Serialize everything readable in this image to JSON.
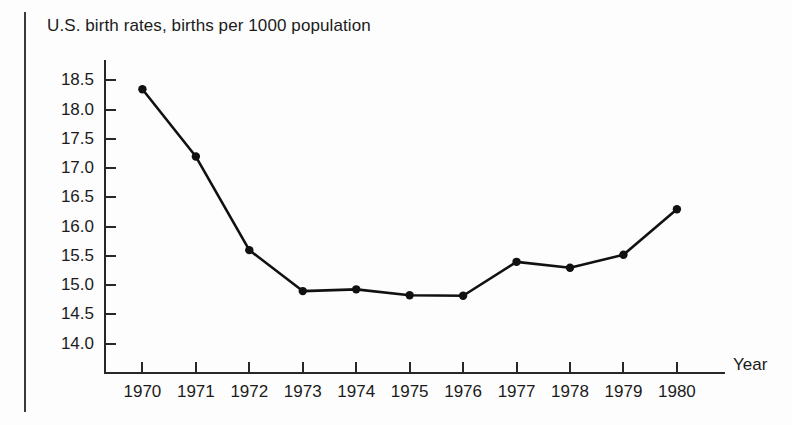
{
  "figure": {
    "title": "U.S. birth rates, births per 1000 population",
    "x_axis_title": "Year"
  },
  "chart_data": {
    "type": "line",
    "title": "U.S. birth rates, births per 1000 population",
    "xlabel": "Year",
    "ylabel": "",
    "categories": [
      "1970",
      "1971",
      "1972",
      "1973",
      "1974",
      "1975",
      "1976",
      "1977",
      "1978",
      "1979",
      "1980"
    ],
    "x": [
      1970,
      1971,
      1972,
      1973,
      1974,
      1975,
      1976,
      1977,
      1978,
      1979,
      1980
    ],
    "values": [
      18.35,
      17.2,
      15.6,
      14.9,
      14.93,
      14.83,
      14.82,
      15.4,
      15.3,
      15.52,
      16.3
    ],
    "series": [
      {
        "name": "U.S. birth rate",
        "values": [
          18.35,
          17.2,
          15.6,
          14.9,
          14.93,
          14.83,
          14.82,
          15.4,
          15.3,
          15.52,
          16.3
        ]
      }
    ],
    "ylim": [
      13.5,
      18.85
    ],
    "xlim": [
      1969.3,
      1980.9
    ],
    "y_ticks": [
      18.5,
      18.0,
      17.5,
      17.0,
      16.5,
      16.0,
      15.5,
      15.0,
      14.5,
      14.0
    ],
    "y_tick_labels": [
      "18.5",
      "18.0",
      "17.5",
      "17.0",
      "16.5",
      "16.0",
      "15.5",
      "15.0",
      "14.5",
      "14.0"
    ],
    "y_minor_unlabeled_ticks": [
      13.5
    ],
    "x_tick_labels": [
      "1970",
      "1971",
      "1972",
      "1973",
      "1974",
      "1975",
      "1976",
      "1977",
      "1978",
      "1979",
      "1980"
    ],
    "grid": false,
    "legend": null,
    "marker": "filled-circle",
    "line_color": "#111111",
    "marker_color": "#111111",
    "background_color": "#fdfdfd"
  }
}
